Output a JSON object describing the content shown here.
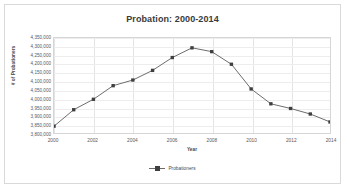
{
  "chart_data": {
    "type": "line",
    "title": "Probation: 2000-2014",
    "xlabel": "Year",
    "ylabel": "# of Probationers",
    "grid": true,
    "legend_position": "bottom",
    "xlim": [
      2000,
      2014
    ],
    "ylim": [
      3800000,
      4350000
    ],
    "x": [
      2000,
      2001,
      2002,
      2003,
      2004,
      2005,
      2006,
      2007,
      2008,
      2009,
      2010,
      2011,
      2012,
      2013,
      2014
    ],
    "xticks": [
      "2000",
      "2002",
      "2004",
      "2006",
      "2008",
      "2010",
      "2012",
      "2014"
    ],
    "yticks": [
      "4,350,000",
      "4,300,000",
      "4,250,000",
      "4,200,000",
      "4,150,000",
      "4,100,000",
      "4,050,000",
      "4,000,000",
      "3,950,000",
      "3,900,000",
      "3,850,000",
      "3,800,000"
    ],
    "series": [
      {
        "name": "Probationers",
        "values": [
          3839532,
          3934708,
          3995165,
          4073987,
          4106598,
          4162536,
          4236800,
          4293000,
          4271000,
          4198000,
          4055000,
          3969000,
          3942000,
          3910000,
          3864000
        ]
      }
    ]
  },
  "legend": {
    "entries": [
      {
        "label": "Probationers",
        "color": "#3f3f3f"
      }
    ]
  },
  "colors": {
    "line": "#6b6b6b",
    "marker": "#3f3f3f",
    "grid": "#ededed",
    "frame": "#d6d6d6",
    "text": "#59595b",
    "title": "#3a3a3a",
    "card_border": "#d9d9d9",
    "background": "#ffffff"
  }
}
